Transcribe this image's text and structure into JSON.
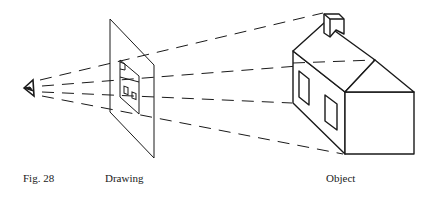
{
  "figure": {
    "number_label": "Fig. 28",
    "drawing_label": "Drawing",
    "object_label": "Object"
  },
  "elements": {
    "eye": "eye-icon",
    "picture_plane": "picture-plane",
    "projected_house": "projected-house-sketch",
    "house": "house-object",
    "sight_lines_count": 4
  },
  "colors": {
    "ink": "#1a1a1a",
    "background": "#ffffff"
  }
}
